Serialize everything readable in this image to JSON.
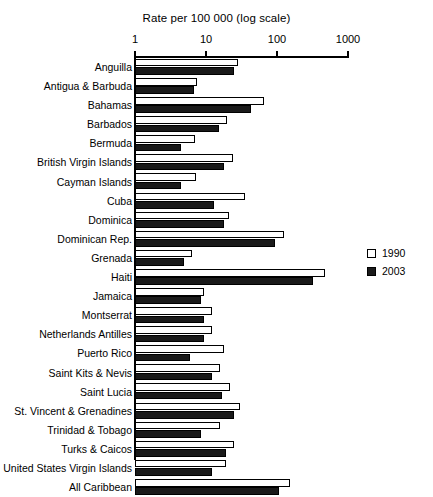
{
  "chart_data": {
    "type": "bar",
    "orientation": "horizontal",
    "title": "Rate per 100 000 (log scale)",
    "xlabel": "Rate per 100 000 (log scale)",
    "ylabel": "",
    "scale": "log",
    "xlim": [
      1,
      1000
    ],
    "xticks": [
      1,
      10,
      100,
      1000
    ],
    "xtick_labels": [
      "1",
      "10",
      "100",
      "1000"
    ],
    "grid": false,
    "legend_position": "right",
    "categories": [
      "Anguilla",
      "Antigua & Barbuda",
      "Bahamas",
      "Barbados",
      "Bermuda",
      "British Virgin Islands",
      "Cayman Islands",
      "Cuba",
      "Dominica",
      "Dominican Rep.",
      "Grenada",
      "Haiti",
      "Jamaica",
      "Montserrat",
      "Netherlands Antilles",
      "Puerto Rico",
      "Saint Kits & Nevis",
      "Saint Lucia",
      "St. Vincent & Grenadines",
      "Trinidad & Tobago",
      "Turks & Caicos",
      "United States Virgin Islands",
      "All Caribbean"
    ],
    "series": [
      {
        "name": "1990",
        "color": "#ffffff",
        "values": [
          28,
          7.5,
          65,
          20,
          7.0,
          24,
          7.2,
          35,
          21,
          125,
          6.3,
          470,
          9.5,
          12,
          12,
          18,
          16,
          22,
          30,
          16,
          25,
          19,
          150
        ]
      },
      {
        "name": "2003",
        "color": "#1a1a1a",
        "values": [
          25,
          6.8,
          43,
          15,
          4.5,
          18,
          4.4,
          13,
          18,
          95,
          4.9,
          320,
          8.5,
          9.5,
          9.5,
          6.0,
          12,
          17,
          25,
          8.5,
          19,
          12,
          105
        ]
      }
    ]
  },
  "legend": {
    "items": [
      {
        "label": "1990",
        "swatch": "white"
      },
      {
        "label": "2003",
        "swatch": "black"
      }
    ]
  }
}
